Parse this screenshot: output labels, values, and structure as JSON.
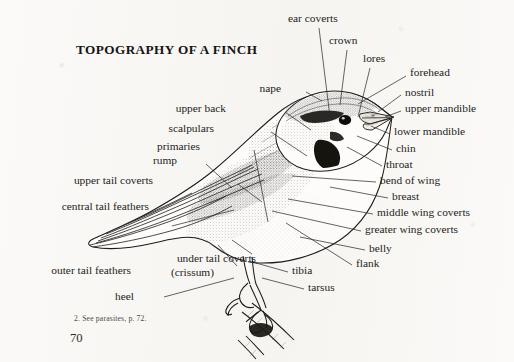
{
  "page": {
    "title": "TOPOGRAPHY OF A FINCH",
    "footnote": "2.  See parasites, p. 72.",
    "page_number": "70",
    "background_color": "#fbfaf8",
    "ink_color": "#1d1d1d"
  },
  "figure": {
    "subject": "finch",
    "style": "line-engraving",
    "caption_title": "TOPOGRAPHY OF A FINCH"
  },
  "labels": [
    {
      "id": "ear-coverts",
      "text": "ear coverts",
      "side": "right",
      "x": 288,
      "y": 18,
      "anchor_x": 330,
      "anchor_y": 117
    },
    {
      "id": "crown",
      "text": "crown",
      "side": "right",
      "x": 329,
      "y": 40,
      "anchor_x": 340,
      "anchor_y": 105
    },
    {
      "id": "lores",
      "text": "lores",
      "side": "right",
      "x": 363,
      "y": 58,
      "anchor_x": 357,
      "anchor_y": 117
    },
    {
      "id": "forehead",
      "text": "forehead",
      "side": "right",
      "x": 410,
      "y": 72,
      "anchor_x": 358,
      "anchor_y": 105
    },
    {
      "id": "nostril",
      "text": "nostril",
      "side": "right",
      "x": 405,
      "y": 92,
      "anchor_x": 377,
      "anchor_y": 113
    },
    {
      "id": "upper-mandible",
      "text": "upper mandible",
      "side": "right",
      "x": 405,
      "y": 108,
      "anchor_x": 382,
      "anchor_y": 118
    },
    {
      "id": "lower-mandible",
      "text": "lower mandible",
      "side": "right",
      "x": 394,
      "y": 131,
      "anchor_x": 372,
      "anchor_y": 126
    },
    {
      "id": "chin",
      "text": "chin",
      "side": "right",
      "x": 396,
      "y": 148,
      "anchor_x": 358,
      "anchor_y": 135
    },
    {
      "id": "throat",
      "text": "throat",
      "side": "right",
      "x": 386,
      "y": 164,
      "anchor_x": 348,
      "anchor_y": 146
    },
    {
      "id": "bend-of-wing",
      "text": "bend of wing",
      "side": "right",
      "x": 380,
      "y": 180,
      "anchor_x": 292,
      "anchor_y": 175
    },
    {
      "id": "breast",
      "text": "breast",
      "side": "right",
      "x": 392,
      "y": 196,
      "anchor_x": 330,
      "anchor_y": 186
    },
    {
      "id": "middle-wing-coverts",
      "text": "middle wing coverts",
      "side": "right",
      "x": 377,
      "y": 212,
      "anchor_x": 288,
      "anchor_y": 198
    },
    {
      "id": "greater-wing-coverts",
      "text": "greater wing coverts",
      "side": "right",
      "x": 365,
      "y": 229,
      "anchor_x": 272,
      "anchor_y": 210
    },
    {
      "id": "belly",
      "text": "belly",
      "side": "right",
      "x": 369,
      "y": 248,
      "anchor_x": 300,
      "anchor_y": 236
    },
    {
      "id": "flank",
      "text": "flank",
      "side": "right",
      "x": 356,
      "y": 263,
      "anchor_x": 286,
      "anchor_y": 222
    },
    {
      "id": "tibia",
      "text": "tibia",
      "side": "right",
      "x": 292,
      "y": 270,
      "anchor_x": 256,
      "anchor_y": 262
    },
    {
      "id": "tarsus",
      "text": "tarsus",
      "side": "right",
      "x": 308,
      "y": 287,
      "anchor_x": 262,
      "anchor_y": 277
    },
    {
      "id": "nape",
      "text": "nape",
      "side": "left",
      "x": 281,
      "y": 88,
      "anchor_x": 305,
      "anchor_y": 104
    },
    {
      "id": "upper-back",
      "text": "upper back",
      "side": "left",
      "x": 226,
      "y": 108,
      "anchor_x": 280,
      "anchor_y": 130
    },
    {
      "id": "scalpulars",
      "text": "scalpulars",
      "side": "left",
      "x": 214,
      "y": 128,
      "anchor_x": 272,
      "anchor_y": 152
    },
    {
      "id": "primaries",
      "text": "primaries",
      "side": "left",
      "x": 200,
      "y": 146,
      "anchor_x": 257,
      "anchor_y": 220
    },
    {
      "id": "rump",
      "text": "rump",
      "side": "left",
      "x": 177,
      "y": 160,
      "anchor_x": 221,
      "anchor_y": 186
    },
    {
      "id": "upper-tail-coverts",
      "text": "upper tail coverts",
      "side": "left",
      "x": 153,
      "y": 180,
      "anchor_x": 196,
      "anchor_y": 198
    },
    {
      "id": "central-tail-feathers",
      "text": "central tail feathers",
      "side": "left",
      "x": 149,
      "y": 206,
      "anchor_x": 118,
      "anchor_y": 222
    },
    {
      "id": "under-tail-coverts",
      "text": "under tail coverts",
      "side": "left",
      "x": 256,
      "y": 258,
      "anchor_x": 222,
      "anchor_y": 238
    },
    {
      "id": "crissum",
      "text": "(crissum)",
      "side": "left",
      "x": 214,
      "y": 272,
      "anchor_x": null,
      "anchor_y": null
    },
    {
      "id": "outer-tail-feathers",
      "text": "outer tail feathers",
      "side": "left",
      "x": 131,
      "y": 270,
      "anchor_x": 146,
      "anchor_y": 246
    },
    {
      "id": "heel",
      "text": "heel",
      "side": "left",
      "x": 134,
      "y": 296,
      "anchor_x": 232,
      "anchor_y": 277
    }
  ]
}
